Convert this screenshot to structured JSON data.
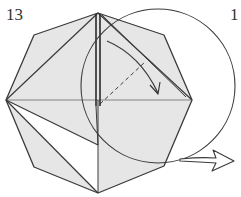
{
  "diagram": {
    "type": "origami-instruction",
    "step_number": "13",
    "next_step_number_partial": "1",
    "colors": {
      "paper_fill": "#e6e6e6",
      "white_region": "#ffffff",
      "line": "#3a3a3a",
      "bold_line": "#2a2a2a"
    },
    "elements": {
      "octagon": "octagonal folded paper base",
      "circle": "magnified/focus circle highlighting right side",
      "dashed_line": "valley fold line",
      "curved_arrow": "fold direction arrow",
      "hollow_arrow": "proceed to next step arrow"
    }
  }
}
